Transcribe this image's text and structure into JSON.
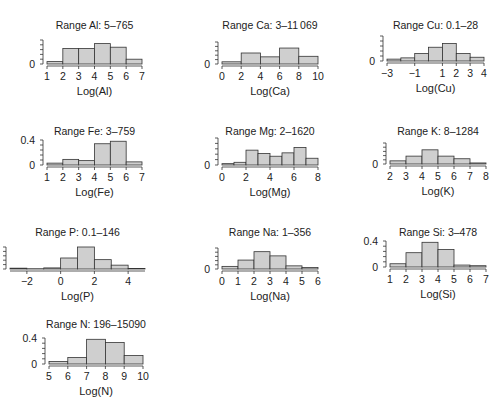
{
  "chart_data": [
    {
      "type": "bar",
      "title": "Range Al: 5–765",
      "xlabel": "Log(Al)",
      "ylabel": "",
      "bins": [
        1,
        2,
        3,
        4,
        5,
        6,
        7
      ],
      "values": [
        0.04,
        0.26,
        0.26,
        0.34,
        0.28,
        0.08
      ],
      "xticks": [
        "1",
        "2",
        "3",
        "4",
        "5",
        "6",
        "7"
      ],
      "xtick_values": [
        1,
        2,
        3,
        4,
        5,
        6,
        7
      ],
      "xlim": [
        1,
        7
      ],
      "yticks": [
        "0"
      ],
      "ylim": [
        0,
        0.4
      ]
    },
    {
      "type": "bar",
      "title": "Range Ca: 3–11 069",
      "xlabel": "Log(Ca)",
      "ylabel": "",
      "bins": [
        0,
        2,
        4,
        6,
        8,
        10
      ],
      "values": [
        0.04,
        0.2,
        0.13,
        0.29,
        0.14
      ],
      "xticks": [
        "0",
        "2",
        "4",
        "6",
        "8",
        "10"
      ],
      "xtick_values": [
        0,
        2,
        4,
        6,
        8,
        10
      ],
      "xlim": [
        0,
        10
      ],
      "yticks": [
        "0"
      ],
      "ylim": [
        0,
        0.4
      ]
    },
    {
      "type": "bar",
      "title": "Range Cu: 0.1–28",
      "xlabel": "Log(Cu)",
      "ylabel": "",
      "bins": [
        -3,
        -2,
        -1,
        0,
        1,
        2,
        3,
        4
      ],
      "values": [
        0.03,
        0.05,
        0.12,
        0.22,
        0.28,
        0.12,
        0.06
      ],
      "xticks": [
        "−3",
        "−1",
        "1",
        "2",
        "3",
        "4"
      ],
      "xtick_values": [
        -3,
        -1,
        1,
        2,
        3,
        4
      ],
      "xtick_positions": [
        -3,
        -1,
        1,
        2,
        3,
        4
      ],
      "xlim": [
        -3,
        4
      ],
      "yticks": [
        "0"
      ],
      "ylim": [
        0,
        0.4
      ]
    },
    {
      "type": "bar",
      "title": "Range Fe: 3–759",
      "xlabel": "Log(Fe)",
      "ylabel": "",
      "bins": [
        1,
        2,
        3,
        4,
        5,
        6,
        7
      ],
      "values": [
        0.03,
        0.09,
        0.07,
        0.34,
        0.38,
        0.05
      ],
      "xticks": [
        "1",
        "2",
        "3",
        "4",
        "5",
        "6",
        "7"
      ],
      "xtick_values": [
        1,
        2,
        3,
        4,
        5,
        6,
        7
      ],
      "xlim": [
        1,
        7
      ],
      "yticks": [
        "0",
        "0.4"
      ],
      "ylim": [
        0,
        0.4
      ]
    },
    {
      "type": "bar",
      "title": "Range Mg: 2–1620",
      "xlabel": "Log(Mg)",
      "ylabel": "",
      "bins": [
        0,
        1,
        2,
        3,
        4,
        5,
        6,
        7,
        8
      ],
      "values": [
        0.02,
        0.04,
        0.22,
        0.17,
        0.13,
        0.18,
        0.26,
        0.1
      ],
      "xticks": [
        "0",
        "2",
        "4",
        "6",
        "8"
      ],
      "xtick_values": [
        0,
        2,
        4,
        6,
        8
      ],
      "xlim": [
        0,
        8
      ],
      "yticks": [
        "0"
      ],
      "ylim": [
        0,
        0.4
      ]
    },
    {
      "type": "bar",
      "title": "Range K: 8–1284",
      "xlabel": "Log(K)",
      "ylabel": "",
      "bins": [
        2,
        3,
        4,
        5,
        6,
        7,
        8
      ],
      "values": [
        0.06,
        0.15,
        0.27,
        0.15,
        0.1,
        0.02
      ],
      "xticks": [
        "2",
        "3",
        "4",
        "5",
        "6",
        "7",
        "8"
      ],
      "xtick_values": [
        2,
        3,
        4,
        5,
        6,
        7,
        8
      ],
      "xlim": [
        2,
        8
      ],
      "yticks": [
        "0"
      ],
      "ylim": [
        0,
        0.4
      ]
    },
    {
      "type": "bar",
      "title": "Range P: 0.1–146",
      "xlabel": "Log(P)",
      "ylabel": "",
      "bins": [
        -3,
        -2,
        -1,
        0,
        1,
        2,
        3,
        4,
        5
      ],
      "values": [
        0.015,
        0.005,
        0.02,
        0.2,
        0.4,
        0.17,
        0.07,
        0.01
      ],
      "xticks": [
        "−2",
        "0",
        "2",
        "4"
      ],
      "xtick_values": [
        -2,
        0,
        2,
        4
      ],
      "xlim": [
        -3,
        5
      ],
      "yticks": [
        "0",
        "0.4"
      ],
      "ylim": [
        0,
        0.4
      ]
    },
    {
      "type": "bar",
      "title": "Range Na: 1–356",
      "xlabel": "Log(Na)",
      "ylabel": "",
      "bins": [
        0,
        1,
        2,
        3,
        4,
        5,
        6
      ],
      "values": [
        0.05,
        0.17,
        0.33,
        0.25,
        0.06,
        0.03
      ],
      "xticks": [
        "0",
        "1",
        "2",
        "3",
        "4",
        "5",
        "6"
      ],
      "xtick_values": [
        0,
        1,
        2,
        3,
        4,
        5,
        6
      ],
      "xlim": [
        0,
        6
      ],
      "yticks": [
        "0"
      ],
      "ylim": [
        0,
        0.4
      ]
    },
    {
      "type": "bar",
      "title": "Range Si: 3–478",
      "xlabel": "Log(Si)",
      "ylabel": "",
      "bins": [
        1,
        2,
        3,
        4,
        5,
        6,
        7
      ],
      "values": [
        0.05,
        0.22,
        0.38,
        0.27,
        0.03,
        0.02
      ],
      "xticks": [
        "1",
        "2",
        "3",
        "4",
        "5",
        "6",
        "7"
      ],
      "xtick_values": [
        1,
        2,
        3,
        4,
        5,
        6,
        7
      ],
      "xlim": [
        1,
        7
      ],
      "yticks": [
        "0",
        "0.4"
      ],
      "ylim": [
        0,
        0.4
      ]
    },
    {
      "type": "bar",
      "title": "Range N: 196–15090",
      "xlabel": "Log(N)",
      "ylabel": "",
      "bins": [
        5,
        6,
        7,
        8,
        9,
        10
      ],
      "values": [
        0.04,
        0.1,
        0.38,
        0.33,
        0.13
      ],
      "xticks": [
        "5",
        "6",
        "7",
        "8",
        "9",
        "10"
      ],
      "xtick_values": [
        5,
        6,
        7,
        8,
        9,
        10
      ],
      "xlim": [
        5,
        10
      ],
      "yticks": [
        "0",
        "0.4"
      ],
      "ylim": [
        0,
        0.4
      ]
    }
  ],
  "layout": {
    "panels": [
      {
        "x0": 47,
        "x1": 142,
        "y0": 64,
        "hscale": 80,
        "tx": 95,
        "ty": 21,
        "ytop": 40
      },
      {
        "x0": 222,
        "x1": 318,
        "y0": 64,
        "hscale": 80,
        "tx": 262,
        "ty": 21,
        "ytop": 42
      },
      {
        "x0": 387,
        "x1": 484,
        "y0": 61,
        "hscale": 80,
        "tx": 446,
        "ty": 21,
        "ytop": 36
      },
      {
        "x0": 47,
        "x1": 142,
        "y0": 165,
        "hscale": 80,
        "tx": 95,
        "ty": 127,
        "ytop": 140
      },
      {
        "x0": 222,
        "x1": 318,
        "y0": 165,
        "hscale": 80,
        "tx": 262,
        "ty": 127,
        "ytop": 138
      },
      {
        "x0": 390,
        "x1": 486,
        "y0": 164,
        "hscale": 80,
        "tx": 448,
        "ty": 127,
        "ytop": 143
      },
      {
        "x0": 10,
        "x1": 145,
        "y0": 269,
        "hscale": 80,
        "tx": 95,
        "ty": 228,
        "ytop": 247
      },
      {
        "x0": 222,
        "x1": 318,
        "y0": 269,
        "hscale": 80,
        "tx": 262,
        "ty": 228,
        "ytop": 248
      },
      {
        "x0": 390,
        "x1": 486,
        "y0": 267,
        "hscale": 80,
        "tx": 450,
        "ty": 228,
        "ytop": 241
      },
      {
        "x0": 49,
        "x1": 143,
        "y0": 364,
        "hscale": 80,
        "tx": 95,
        "ty": 320,
        "ytop": 338
      }
    ]
  }
}
